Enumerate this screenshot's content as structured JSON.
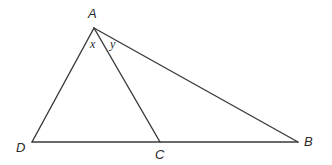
{
  "diagram": {
    "type": "geometry-triangle",
    "width": 332,
    "height": 165,
    "stroke_color": "#3a3a3a",
    "label_color": "#2a2a2a",
    "points": {
      "A": {
        "x": 94,
        "y": 28
      },
      "D": {
        "x": 32,
        "y": 142
      },
      "C": {
        "x": 160,
        "y": 142
      },
      "B": {
        "x": 298,
        "y": 142
      }
    },
    "segments": [
      {
        "from": "A",
        "to": "D"
      },
      {
        "from": "A",
        "to": "C"
      },
      {
        "from": "A",
        "to": "B"
      },
      {
        "from": "D",
        "to": "B"
      }
    ],
    "vertex_labels": {
      "A": "A",
      "B": "B",
      "C": "C",
      "D": "D"
    },
    "angle_labels": {
      "x": "x",
      "y": "y"
    }
  }
}
